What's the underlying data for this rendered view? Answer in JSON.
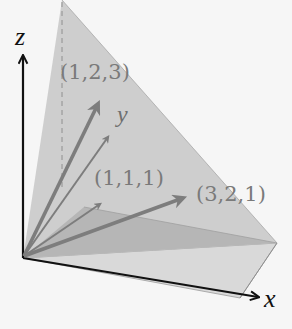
{
  "diagram": {
    "type": "3d-vector-plane",
    "axes": {
      "x": {
        "label": "x"
      },
      "y": {
        "label": "y"
      },
      "z": {
        "label": "z"
      }
    },
    "vectors": [
      {
        "label": "(1,2,3)",
        "components": [
          1,
          2,
          3
        ]
      },
      {
        "label": "(1,1,1)",
        "components": [
          1,
          1,
          1
        ]
      },
      {
        "label": "(3,2,1)",
        "components": [
          3,
          2,
          1
        ]
      }
    ],
    "colors": {
      "background": "#f6f6f6",
      "plane_light": "#cdcdcd",
      "plane_dark": "#b4b4b4",
      "vector": "#7d7d7d",
      "axis": "#111111",
      "label": "#7a7a7a"
    }
  }
}
